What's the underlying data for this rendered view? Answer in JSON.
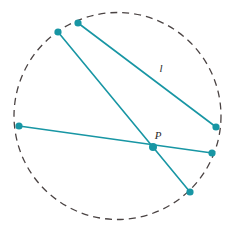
{
  "figure": {
    "canvas": {
      "width": 231,
      "height": 235,
      "background": "#ffffff"
    },
    "colors": {
      "chord": "#1896a4",
      "vertex": "#1896a4",
      "circle_stroke": "#4a4343",
      "label": "#2a2a2a"
    },
    "circle": {
      "name": "dashed-circle",
      "cx": 117.5,
      "cy": 116,
      "r": 103.5,
      "stroke_width": 1.3,
      "dash_pattern": "7 5",
      "style": "dashed"
    },
    "points": [
      {
        "id": "A",
        "name": "point-top",
        "x": 78,
        "y": 23,
        "r": 3.6
      },
      {
        "id": "B",
        "name": "point-upper-left",
        "x": 58,
        "y": 32,
        "r": 3.6
      },
      {
        "id": "C",
        "name": "point-left",
        "x": 19,
        "y": 126,
        "r": 3.6
      },
      {
        "id": "D",
        "name": "point-right-upper",
        "x": 216,
        "y": 127,
        "r": 3.6
      },
      {
        "id": "E",
        "name": "point-right-lower",
        "x": 212,
        "y": 153,
        "r": 3.6
      },
      {
        "id": "F",
        "name": "point-bottom",
        "x": 190,
        "y": 192,
        "r": 3.6
      },
      {
        "id": "P",
        "name": "point-intersection",
        "x": 153,
        "y": 147,
        "r": 4.0
      }
    ],
    "chords": [
      {
        "name": "chord-l",
        "from": "A",
        "to": "D",
        "x1": 78,
        "y1": 23,
        "x2": 216,
        "y2": 127,
        "width": 1.6
      },
      {
        "name": "chord-upper-left-to-bottom",
        "from": "B",
        "to": "F",
        "x1": 58,
        "y1": 32,
        "x2": 190,
        "y2": 192,
        "width": 1.6
      },
      {
        "name": "chord-left-to-right-lower",
        "from": "C",
        "to": "E",
        "x1": 19,
        "y1": 126,
        "x2": 212,
        "y2": 153,
        "width": 1.6
      }
    ],
    "labels": [
      {
        "name": "chord-label-l",
        "text": "l",
        "x": 161,
        "y": 72,
        "anchor": "middle"
      },
      {
        "name": "point-label-p",
        "text": "P",
        "x": 158,
        "y": 139,
        "anchor": "middle"
      }
    ]
  }
}
